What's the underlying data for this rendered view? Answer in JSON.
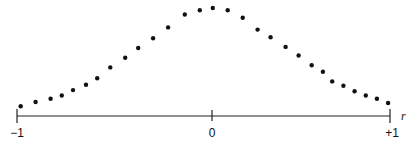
{
  "chart_data": {
    "type": "scatter",
    "title": "",
    "xlabel": "r",
    "ylabel": "",
    "xlim": [
      -1,
      1
    ],
    "ylim": [
      0,
      1
    ],
    "grid": false,
    "legend": null,
    "x_ticks": [
      {
        "value": -1,
        "label": "−1"
      },
      {
        "value": 0,
        "label": "0"
      },
      {
        "value": 1,
        "label": "+1"
      }
    ],
    "points": [
      {
        "x": -0.98,
        "y": 0.09
      },
      {
        "x": -0.9,
        "y": 0.13
      },
      {
        "x": -0.82,
        "y": 0.16
      },
      {
        "x": -0.76,
        "y": 0.19
      },
      {
        "x": -0.7,
        "y": 0.24
      },
      {
        "x": -0.63,
        "y": 0.29
      },
      {
        "x": -0.57,
        "y": 0.35
      },
      {
        "x": -0.5,
        "y": 0.45
      },
      {
        "x": -0.42,
        "y": 0.54
      },
      {
        "x": -0.35,
        "y": 0.63
      },
      {
        "x": -0.27,
        "y": 0.72
      },
      {
        "x": -0.19,
        "y": 0.82
      },
      {
        "x": -0.1,
        "y": 0.94
      },
      {
        "x": -0.02,
        "y": 0.98
      },
      {
        "x": 0.05,
        "y": 1.0
      },
      {
        "x": 0.13,
        "y": 0.98
      },
      {
        "x": 0.21,
        "y": 0.91
      },
      {
        "x": 0.29,
        "y": 0.8
      },
      {
        "x": 0.36,
        "y": 0.73
      },
      {
        "x": 0.44,
        "y": 0.64
      },
      {
        "x": 0.51,
        "y": 0.56
      },
      {
        "x": 0.58,
        "y": 0.47
      },
      {
        "x": 0.64,
        "y": 0.41
      },
      {
        "x": 0.69,
        "y": 0.32
      },
      {
        "x": 0.75,
        "y": 0.28
      },
      {
        "x": 0.81,
        "y": 0.23
      },
      {
        "x": 0.87,
        "y": 0.19
      },
      {
        "x": 0.93,
        "y": 0.16
      },
      {
        "x": 0.99,
        "y": 0.12
      }
    ],
    "marker": {
      "shape": "circle",
      "color": "#111111",
      "size": 4
    }
  },
  "axis": {
    "color": "#222222",
    "variable_label": "r",
    "tick_labels": [
      "−1",
      "0",
      "+1"
    ]
  }
}
